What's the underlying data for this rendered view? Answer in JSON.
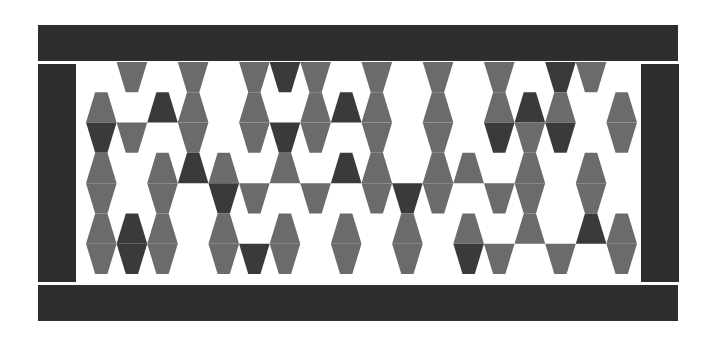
{
  "artwork": {
    "title": "Tessellated Trapezoid Panel",
    "canvas": {
      "width": 715,
      "height": 346
    },
    "background_color": "#ffffff",
    "frame": {
      "color": "#2e2e2e",
      "bars": [
        {
          "name": "top",
          "x": 38,
          "y": 25,
          "width": 640,
          "height": 36
        },
        {
          "name": "bottom",
          "x": 38,
          "y": 285,
          "width": 640,
          "height": 36
        },
        {
          "name": "left",
          "x": 38,
          "y": 64,
          "width": 38,
          "height": 218
        },
        {
          "name": "right",
          "x": 641,
          "y": 64,
          "width": 38,
          "height": 218
        }
      ]
    },
    "panel": {
      "x": 86,
      "y": 62,
      "width": 551,
      "height": 212,
      "background_color": "#ffffff",
      "rows": 7,
      "columns": 18,
      "row_height": 30.3,
      "column_width": 30.6,
      "trapezoid_inset_ratio": 0.3,
      "palette": {
        "white": "#ffffff",
        "mid_gray": "#6b6b6b",
        "dark_gray": "#3a3a3a"
      },
      "row_orientation": [
        "down",
        "up",
        "down",
        "up",
        "down",
        "up",
        "down"
      ],
      "tiles": [
        {
          "row": 0,
          "fills": [
            "w",
            "m",
            "w",
            "m",
            "w",
            "m",
            "d",
            "m",
            "w",
            "m",
            "w",
            "m",
            "w",
            "m",
            "w",
            "d",
            "m",
            "w"
          ]
        },
        {
          "row": 1,
          "fills": [
            "m",
            "w",
            "d",
            "m",
            "w",
            "m",
            "w",
            "m",
            "d",
            "m",
            "w",
            "m",
            "w",
            "m",
            "d",
            "m",
            "w",
            "m"
          ]
        },
        {
          "row": 2,
          "fills": [
            "d",
            "m",
            "w",
            "m",
            "w",
            "m",
            "d",
            "m",
            "w",
            "m",
            "w",
            "m",
            "w",
            "d",
            "m",
            "d",
            "w",
            "m"
          ]
        },
        {
          "row": 3,
          "fills": [
            "m",
            "w",
            "m",
            "d",
            "m",
            "w",
            "m",
            "w",
            "d",
            "m",
            "w",
            "m",
            "m",
            "w",
            "m",
            "w",
            "m",
            "w"
          ]
        },
        {
          "row": 4,
          "fills": [
            "m",
            "w",
            "m",
            "w",
            "d",
            "m",
            "w",
            "m",
            "w",
            "m",
            "d",
            "m",
            "w",
            "m",
            "m",
            "w",
            "m",
            "w"
          ]
        },
        {
          "row": 5,
          "fills": [
            "m",
            "d",
            "m",
            "w",
            "m",
            "w",
            "m",
            "w",
            "m",
            "w",
            "m",
            "w",
            "m",
            "w",
            "m",
            "w",
            "d",
            "m"
          ]
        },
        {
          "row": 6,
          "fills": [
            "m",
            "d",
            "m",
            "w",
            "m",
            "d",
            "m",
            "w",
            "m",
            "w",
            "m",
            "w",
            "d",
            "m",
            "w",
            "m",
            "w",
            "m"
          ]
        }
      ]
    }
  }
}
